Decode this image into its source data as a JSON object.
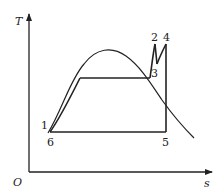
{
  "diagram": {
    "type": "T-s diagram (Rankine cycle with reheat)",
    "axes": {
      "y_label": "T",
      "x_label": "s",
      "origin_label": "O"
    },
    "points": [
      {
        "id": "1",
        "label": "1"
      },
      {
        "id": "2",
        "label": "2"
      },
      {
        "id": "3",
        "label": "3"
      },
      {
        "id": "4",
        "label": "4"
      },
      {
        "id": "5",
        "label": "5"
      },
      {
        "id": "6",
        "label": "6"
      }
    ],
    "colors": {
      "line": "#222222",
      "background": "#ffffff"
    }
  }
}
